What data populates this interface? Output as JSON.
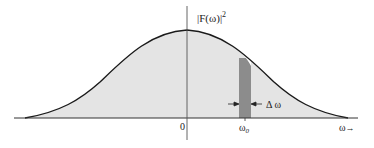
{
  "diagram": {
    "y_axis_label": "|F(ω)|",
    "y_axis_label_sup": "2",
    "origin_label": "0",
    "band_center_label": "ω",
    "band_center_sub": "0",
    "bandwidth_label": "Δ ω",
    "x_axis_label": "ω",
    "x_axis_arrow": "→",
    "colors": {
      "curve": "#1a1a1a",
      "fill": "#e4e4e4",
      "band": "#8c8c8c",
      "axis": "#333333"
    }
  }
}
